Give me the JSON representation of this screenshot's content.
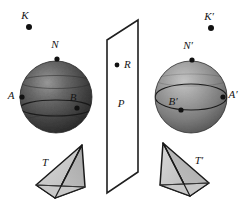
{
  "figure": {
    "background_color": "#ffffff",
    "width": 249,
    "height": 216
  },
  "labels": {
    "K": "K",
    "K_prime": "K′",
    "N": "N",
    "N_prime": "N′",
    "A": "A",
    "A_prime": "A′",
    "B": "B",
    "B_prime": "B′",
    "R": "R",
    "P": "P",
    "T": "T",
    "T_prime": "T′"
  },
  "colors": {
    "outline": "#1a1a1a",
    "sphere_left_dark": "#3a3a3a",
    "sphere_left_light": "#8d8d8d",
    "sphere_right_dark": "#5f5f5f",
    "sphere_right_light": "#b4b4b4",
    "tetra_fill_light": "#cfcfcf",
    "tetra_fill_mid": "#b6b6b6",
    "point_fill": "#111111",
    "plane_stroke": "#1f1f1f"
  },
  "objects": {
    "sphere_left": {
      "name": "sphere-left",
      "cx": 56,
      "cy": 97,
      "r": 36
    },
    "sphere_right": {
      "name": "sphere-right",
      "cx": 191,
      "cy": 97,
      "r": 36
    },
    "plane": {
      "name": "plane-P",
      "points": "107,40 138,20 138,172 107,193"
    },
    "tetra_left": {
      "name": "tetrahedron-T"
    },
    "tetra_right": {
      "name": "tetrahedron-T-prime"
    }
  },
  "points": {
    "K": {
      "x": 29,
      "y": 27
    },
    "K_prime": {
      "x": 211,
      "y": 28
    },
    "N": {
      "x": 57,
      "y": 59
    },
    "N_prime": {
      "x": 192,
      "y": 60
    },
    "A": {
      "x": 22,
      "y": 97
    },
    "A_prime": {
      "x": 223,
      "y": 97
    },
    "B": {
      "x": 77,
      "y": 108
    },
    "B_prime": {
      "x": 181,
      "y": 110
    },
    "R": {
      "x": 117,
      "y": 65
    }
  }
}
